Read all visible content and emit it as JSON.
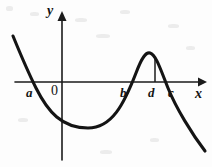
{
  "figure": {
    "background_color": "#fdfdfd",
    "ink_color": "#141414",
    "labels": {
      "y_axis": "y",
      "x_axis": "x",
      "origin": "0",
      "root_a": "a",
      "root_b": "b",
      "point_d": "d",
      "root_c": "c"
    }
  },
  "chart_data": {
    "type": "line",
    "title": "",
    "xlabel": "x",
    "ylabel": "y",
    "grid": false,
    "legend": "none",
    "axes": {
      "x_axis_y_pixel": 82,
      "y_axis_x_pixel": 62,
      "x_axis_from": 15,
      "x_axis_to": 205,
      "y_axis_from": 160,
      "y_axis_to": 12
    },
    "annotations": [
      {
        "label": "a",
        "type": "x-intercept",
        "x": 33,
        "y": 82,
        "label_x": 27,
        "label_y": 87
      },
      {
        "label": "0",
        "type": "origin",
        "x": 62,
        "y": 82,
        "label_x": 52,
        "label_y": 85
      },
      {
        "label": "b",
        "type": "x-intercept",
        "x": 128,
        "y": 82,
        "label_x": 121,
        "label_y": 87
      },
      {
        "label": "d",
        "type": "abscissa-of-local-maximum",
        "x": 155,
        "y": 82,
        "label_x": 149,
        "label_y": 87
      },
      {
        "label": "c",
        "type": "x-intercept",
        "x": 176,
        "y": 82,
        "label_x": 169,
        "label_y": 87
      },
      {
        "label": "x",
        "type": "axis-name",
        "label_x": 195,
        "label_y": 88
      },
      {
        "label": "y",
        "type": "axis-name",
        "label_x": 47,
        "label_y": 5
      }
    ],
    "key_points": [
      {
        "name": "left-endpoint",
        "x": 13,
        "y": 36
      },
      {
        "name": "root-a",
        "x": 33,
        "y": 82
      },
      {
        "name": "local-minimum",
        "x": 88,
        "y": 128
      },
      {
        "name": "root-b",
        "x": 128,
        "y": 82
      },
      {
        "name": "local-maximum",
        "x": 148,
        "y": 52
      },
      {
        "name": "root-c",
        "x": 176,
        "y": 82
      },
      {
        "name": "right-endpoint",
        "x": 205,
        "y": 151
      }
    ],
    "drop_line": {
      "x": 155,
      "y_top": 57,
      "y_bottom": 82
    },
    "curve_path": "M 13 36 C 22 58, 27 70, 36 88 C 48 112, 62 128, 88 128 C 112 128, 124 104, 136 73 C 142 57, 146 52, 150 53 C 156 55, 160 68, 168 88 C 176 108, 192 134, 205 151"
  }
}
